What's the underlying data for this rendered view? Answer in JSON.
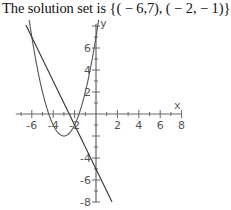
{
  "caption": "The solution set is {( − 6,7), ( − 2, − 1)}.",
  "chart_data": {
    "type": "line",
    "xlabel": "x",
    "ylabel": "y",
    "xlim": [
      -7.5,
      8
    ],
    "ylim": [
      -8,
      8
    ],
    "x_tick_labels": [
      "-6",
      "-4",
      "-2",
      "2",
      "4",
      "6",
      "8"
    ],
    "y_tick_labels": [
      "6",
      "4",
      "2",
      "-4",
      "-6",
      "-8"
    ],
    "grid": false,
    "series": [
      {
        "name": "parabola",
        "equation": "y = (x+3)^2 - 2",
        "x": [
          -6.2,
          -6,
          -5,
          -4,
          -3,
          -2,
          -1,
          0,
          0.2
        ],
        "values": [
          8.24,
          7,
          2,
          -1,
          -2,
          -1,
          2,
          7,
          8.24
        ]
      },
      {
        "name": "line",
        "equation": "y = -2x - 5",
        "x": [
          -6.5,
          -6,
          -2,
          0,
          1.5
        ],
        "values": [
          8,
          7,
          -1,
          -5,
          -8
        ]
      }
    ],
    "intersections": [
      [
        -6,
        7
      ],
      [
        -2,
        -1
      ]
    ]
  },
  "axes": {
    "x_label": "x",
    "y_label": "y"
  }
}
